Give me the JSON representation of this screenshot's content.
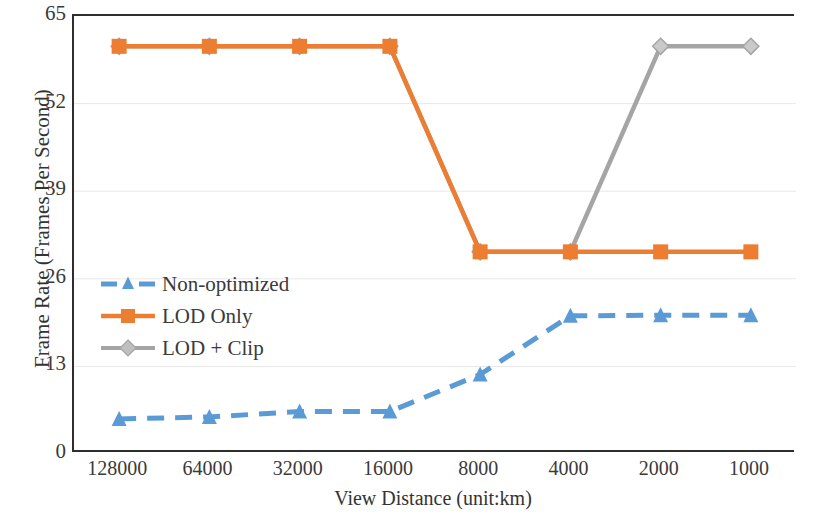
{
  "chart_data": {
    "type": "line",
    "title": "",
    "xlabel": "View Distance (unit:km)",
    "ylabel": "Frame Rate (Frames Per Second)",
    "categories": [
      "128000",
      "64000",
      "32000",
      "16000",
      "8000",
      "4000",
      "2000",
      "1000"
    ],
    "ylim": [
      0,
      65
    ],
    "yticks": [
      0,
      13,
      26,
      39,
      52,
      65
    ],
    "grid": true,
    "legend_position": "inside-left",
    "series": [
      {
        "name": "Non-optimized",
        "color": "#5B9BD5",
        "marker": "triangle",
        "dashed": true,
        "values": [
          5.2,
          5.5,
          6.3,
          6.3,
          11.8,
          20.5,
          20.6,
          20.6
        ]
      },
      {
        "name": "LOD Only",
        "color": "#ED7D31",
        "marker": "square",
        "dashed": false,
        "values": [
          60.5,
          60.5,
          60.5,
          60.5,
          30.0,
          30.0,
          30.0,
          30.0
        ]
      },
      {
        "name": "LOD + Clip",
        "color": "#A5A5A5",
        "marker": "diamond",
        "dashed": false,
        "values": [
          60.5,
          60.5,
          60.5,
          60.5,
          30.0,
          30.0,
          60.5,
          60.5
        ]
      }
    ]
  },
  "axis": {
    "y_tick_labels": [
      "65",
      "52",
      "39",
      "26",
      "13",
      "0"
    ],
    "x_tick_labels": [
      "128000",
      "64000",
      "32000",
      "16000",
      "8000",
      "4000",
      "2000",
      "1000"
    ],
    "y_title": "Frame Rate (Frames Per Second)",
    "x_title": "View Distance (unit:km)"
  },
  "legend": {
    "items": [
      {
        "label": "Non-optimized"
      },
      {
        "label": "LOD Only"
      },
      {
        "label": "LOD + Clip"
      }
    ]
  }
}
